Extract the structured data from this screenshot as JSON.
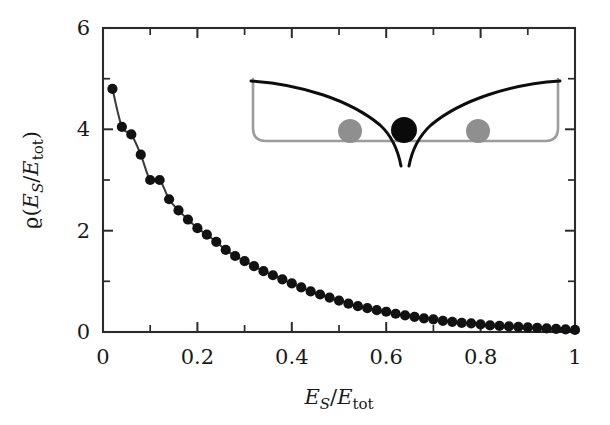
{
  "figure": {
    "background_color": "#ffffff",
    "ink_color": "#191919",
    "marker_color": "#121212",
    "curve_color": "#3a3a3a",
    "inset_well_color": "#9c9c9c",
    "inset_curve_color": "#0d0d0d"
  },
  "chart_data": {
    "type": "scatter",
    "title": "",
    "subtitle": "",
    "xlabel": "E_S/E_tot",
    "ylabel": "ϱ(E_S/E_tot)",
    "xlabel_parts": {
      "main": "E",
      "sub": "S",
      "sep": "/",
      "main2": "E",
      "sub2": "tot"
    },
    "ylabel_parts": {
      "rho": "ϱ",
      "open": "(",
      "main": "E",
      "sub": "S",
      "sep": "/",
      "main2": "E",
      "sub2": "tot",
      "close": ")"
    },
    "xlim": [
      0,
      1
    ],
    "ylim": [
      0,
      6
    ],
    "xticks": [
      0,
      0.2,
      0.4,
      0.6,
      0.8,
      1
    ],
    "xtick_labels": [
      "0",
      "0.2",
      "0.4",
      "0.6",
      "0.8",
      "1"
    ],
    "yticks": [
      0,
      2,
      4,
      6
    ],
    "ytick_labels": [
      "0",
      "2",
      "4",
      "6"
    ],
    "x_minor_step": 0.1,
    "y_minor_step": 1,
    "grid": false,
    "legend": null,
    "legend_position": "none",
    "series": [
      {
        "name": "rho(E_S/E_tot)",
        "marker": "filled-circle",
        "line": "solid",
        "x": [
          0.02,
          0.04,
          0.06,
          0.08,
          0.1,
          0.12,
          0.14,
          0.16,
          0.18,
          0.2,
          0.22,
          0.24,
          0.26,
          0.28,
          0.3,
          0.32,
          0.34,
          0.36,
          0.38,
          0.4,
          0.42,
          0.44,
          0.46,
          0.48,
          0.5,
          0.52,
          0.54,
          0.56,
          0.58,
          0.6,
          0.62,
          0.64,
          0.66,
          0.68,
          0.7,
          0.72,
          0.74,
          0.76,
          0.78,
          0.8,
          0.82,
          0.84,
          0.86,
          0.88,
          0.9,
          0.92,
          0.94,
          0.96,
          0.98,
          1.0
        ],
        "y": [
          4.8,
          4.05,
          3.9,
          3.5,
          3.0,
          3.0,
          2.62,
          2.4,
          2.22,
          2.05,
          1.92,
          1.78,
          1.62,
          1.5,
          1.4,
          1.3,
          1.2,
          1.12,
          1.04,
          0.96,
          0.88,
          0.8,
          0.74,
          0.68,
          0.62,
          0.56,
          0.51,
          0.47,
          0.43,
          0.4,
          0.36,
          0.33,
          0.3,
          0.27,
          0.25,
          0.22,
          0.2,
          0.18,
          0.17,
          0.15,
          0.13,
          0.12,
          0.11,
          0.1,
          0.09,
          0.08,
          0.07,
          0.06,
          0.05,
          0.04
        ]
      }
    ],
    "fit_curve": {
      "name": "smooth-fit",
      "description": "monotonically decaying smooth curve through the data points"
    },
    "inset": {
      "description": "schematic of a confining box potential with a Coulomb singularity at the center",
      "elements": [
        {
          "name": "box-potential-well",
          "color": "#9c9c9c"
        },
        {
          "name": "coulomb-potential-curve",
          "color": "#0d0d0d"
        },
        {
          "name": "central-ion",
          "color": "#0a0a0a",
          "x_frac": 0.5
        },
        {
          "name": "left-atom",
          "color": "#8f8f8f",
          "x_frac": 0.31
        },
        {
          "name": "right-atom",
          "color": "#8f8f8f",
          "x_frac": 0.68
        }
      ]
    }
  }
}
